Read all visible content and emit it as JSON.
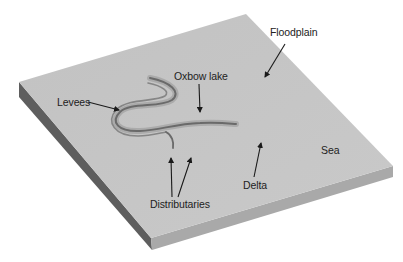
{
  "diagram": {
    "type": "river landform block diagram",
    "colors": {
      "surface": "#c4c4c4",
      "left_edge": "#5e5e5e",
      "front_edge": "#a8a8a8",
      "channel": "#6f6f6f",
      "arrow": "#1a1a1a",
      "text": "#222222"
    },
    "labels": {
      "floodplain": "Floodplain",
      "oxbow_lake": "Oxbow lake",
      "levees": "Levees",
      "distributaries": "Distributaries",
      "delta": "Delta",
      "sea": "Sea"
    }
  }
}
